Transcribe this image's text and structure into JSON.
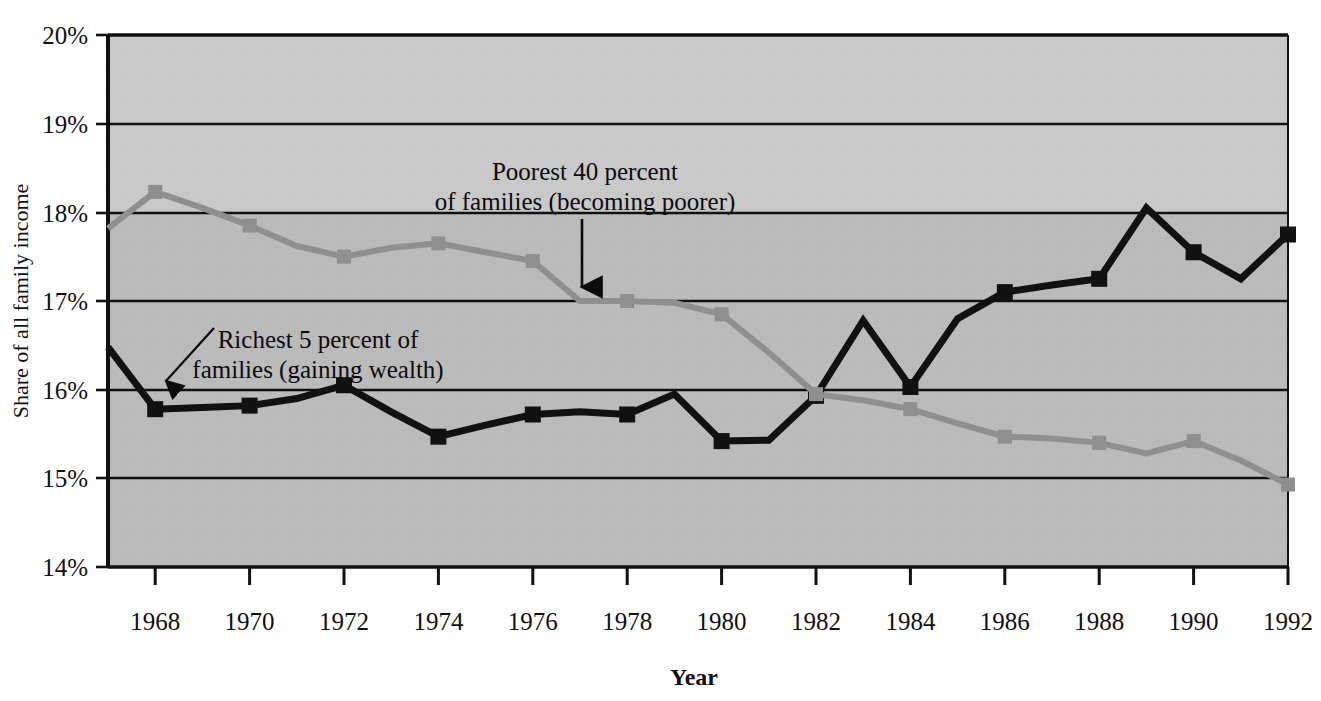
{
  "chart_data": {
    "type": "line",
    "title": "",
    "xlabel": "Year",
    "ylabel": "Share of all family income",
    "xlim": [
      1967,
      1992
    ],
    "ylim": [
      14,
      20
    ],
    "ytick_labels": [
      "20%",
      "19%",
      "18%",
      "17%",
      "16%",
      "15%",
      "14%"
    ],
    "ytick_values": [
      20,
      19,
      18,
      17,
      16,
      15,
      14
    ],
    "xtick_labels": [
      "1968",
      "1970",
      "1972",
      "1974",
      "1976",
      "1978",
      "1980",
      "1982",
      "1984",
      "1986",
      "1988",
      "1990",
      "1992"
    ],
    "xtick_values": [
      1968,
      1970,
      1972,
      1974,
      1976,
      1978,
      1980,
      1982,
      1984,
      1986,
      1988,
      1990,
      1992
    ],
    "grid": "horizontal",
    "legend_position": "inline-annotations",
    "plot_background": "#bcbcbc",
    "upper_band_background": "#c9c9c9",
    "x": [
      1967,
      1968,
      1969,
      1970,
      1971,
      1972,
      1973,
      1974,
      1975,
      1976,
      1977,
      1978,
      1979,
      1980,
      1981,
      1982,
      1983,
      1984,
      1985,
      1986,
      1987,
      1988,
      1989,
      1990,
      1991,
      1992
    ],
    "series": [
      {
        "name": "Richest 5 percent of families",
        "color": "#111111",
        "marker": "square",
        "markers_at": [
          1968,
          1970,
          1972,
          1974,
          1976,
          1978,
          1980,
          1982,
          1984,
          1986,
          1988,
          1990,
          1992
        ],
        "values": [
          16.48,
          15.78,
          15.8,
          15.82,
          15.9,
          16.05,
          15.75,
          15.47,
          15.6,
          15.72,
          15.75,
          15.72,
          15.95,
          15.42,
          15.43,
          15.93,
          16.78,
          16.03,
          16.8,
          17.1,
          17.18,
          17.25,
          18.05,
          17.55,
          17.25,
          17.75
        ]
      },
      {
        "name": "Poorest 40 percent of families",
        "color": "#8f8f8f",
        "marker": "square",
        "markers_at": [
          1968,
          1970,
          1972,
          1974,
          1976,
          1978,
          1980,
          1982,
          1984,
          1986,
          1988,
          1990,
          1992
        ],
        "values": [
          17.82,
          18.23,
          18.05,
          17.85,
          17.62,
          17.5,
          17.6,
          17.65,
          17.55,
          17.45,
          17.0,
          17.0,
          16.98,
          16.85,
          16.42,
          15.95,
          15.88,
          15.78,
          15.62,
          15.47,
          15.45,
          15.4,
          15.28,
          15.42,
          15.2,
          14.93
        ]
      }
    ],
    "annotations": [
      {
        "id": "poorest-annotation",
        "line1": "Poorest 40 percent",
        "line2": "of families (becoming poorer)",
        "arrow": "down",
        "points_to_year": 1977,
        "points_to_value": 17.0
      },
      {
        "id": "richest-annotation",
        "line1": "Richest 5 percent of",
        "line2": "families (gaining wealth)",
        "arrow": "down-left",
        "points_to_year": 1968,
        "points_to_value": 16.0
      }
    ]
  }
}
